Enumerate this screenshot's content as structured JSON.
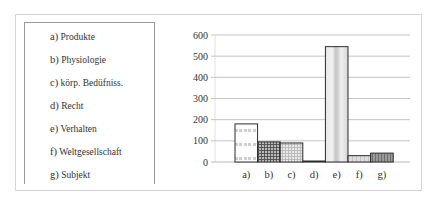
{
  "legend": {
    "items": [
      {
        "key": "a)",
        "label": "Produkte"
      },
      {
        "key": "b)",
        "label": "Physiologie"
      },
      {
        "key": "c)",
        "label": "körp. Bedüfniss."
      },
      {
        "key": "d)",
        "label": "Recht"
      },
      {
        "key": "e)",
        "label": "Verhalten"
      },
      {
        "key": "f)",
        "label": "Weltgesellschaft"
      },
      {
        "key": "g)",
        "label": "Subjekt"
      }
    ]
  },
  "chart_data": {
    "type": "bar",
    "title": "",
    "xlabel": "",
    "ylabel": "",
    "categories": [
      "a)",
      "b)",
      "c)",
      "d)",
      "e)",
      "f)",
      "g)"
    ],
    "category_labels": [
      "Produkte",
      "Physiologie",
      "körp. Bedüfniss.",
      "Recht",
      "Verhalten",
      "Weltgesellschaft",
      "Subjekt"
    ],
    "values": [
      180,
      95,
      90,
      2,
      545,
      30,
      42
    ],
    "ylim": [
      0,
      600
    ],
    "yticks": [
      0,
      100,
      200,
      300,
      400,
      500,
      600
    ],
    "grid": true,
    "legend_position": "left"
  }
}
